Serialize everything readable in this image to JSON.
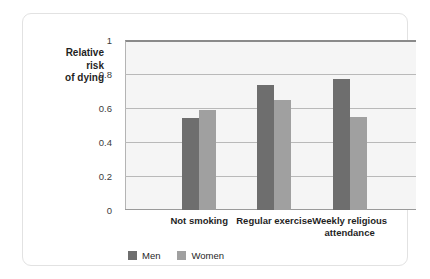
{
  "chart_data": {
    "type": "bar",
    "title": "",
    "xlabel": "",
    "ylabel": "Relative risk of dying",
    "ylabel_lines": [
      "Relative",
      "risk",
      "of dying"
    ],
    "categories": [
      "Not smoking",
      "Regular exercise",
      "Weekly religious attendance"
    ],
    "category_lines": [
      [
        "Not smoking"
      ],
      [
        "Regular exercise"
      ],
      [
        "Weekly religious",
        "attendance"
      ]
    ],
    "series": [
      {
        "name": "Men",
        "color": "#6e6e6e",
        "values": [
          0.54,
          0.735,
          0.77
        ]
      },
      {
        "name": "Women",
        "color": "#a0a0a0",
        "values": [
          0.59,
          0.65,
          0.55
        ]
      }
    ],
    "ylim": [
      0,
      1
    ],
    "yticks": [
      0,
      0.2,
      0.4,
      0.6,
      0.8,
      1
    ],
    "ytick_labels": [
      "0",
      "0.2",
      "0.4",
      "0.6",
      "0.8",
      "1"
    ],
    "grid": true,
    "legend_position": "bottom-left"
  },
  "legend": {
    "items": [
      {
        "label": "Men",
        "color": "#6e6e6e"
      },
      {
        "label": "Women",
        "color": "#a0a0a0"
      }
    ]
  },
  "colors": {
    "men": "#6e6e6e",
    "women": "#a0a0a0",
    "plot_background": "#f5f5f5",
    "gridline": "#b9b9b9",
    "card_border": "#e2e2e2"
  }
}
